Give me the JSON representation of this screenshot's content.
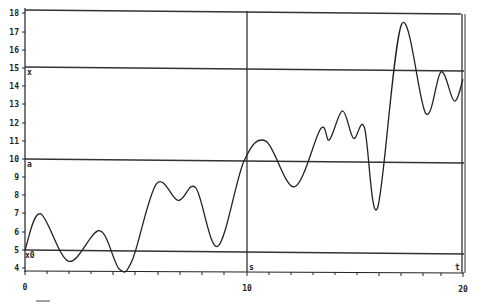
{
  "chart_data": {
    "type": "line",
    "title": "",
    "xlabel": "",
    "ylabel": "",
    "xlim": [
      0,
      20
    ],
    "ylim": [
      4,
      18
    ],
    "grid": false,
    "legend": null,
    "x_ticks": [
      "0",
      "10",
      "20"
    ],
    "y_ticks": [
      "4",
      "5",
      "6",
      "7",
      "8",
      "9",
      "10",
      "11",
      "12",
      "13",
      "14",
      "15",
      "16",
      "17",
      "18"
    ],
    "series": [
      {
        "name": "curve",
        "x": [
          0,
          0.7,
          2.0,
          3.4,
          4.3,
          4.9,
          6.0,
          7.0,
          7.8,
          8.8,
          10.0,
          11.0,
          12.3,
          13.5,
          13.9,
          14.5,
          15.0,
          15.5,
          16.1,
          17.2,
          18.3,
          19.0,
          19.6,
          20.0
        ],
        "values": [
          5.0,
          7.0,
          4.4,
          6.1,
          4.0,
          4.5,
          8.7,
          7.8,
          8.5,
          5.3,
          10.0,
          11.1,
          8.6,
          11.8,
          11.2,
          12.8,
          11.3,
          11.9,
          7.5,
          17.6,
          12.7,
          15.0,
          13.4,
          14.6
        ]
      }
    ],
    "reference_lines": {
      "horizontal": [
        {
          "y": 18,
          "label": ""
        },
        {
          "y": 15,
          "label": "x"
        },
        {
          "y": 10,
          "label": "a"
        },
        {
          "y": 5,
          "label": "x0"
        }
      ],
      "vertical": [
        {
          "x": 10,
          "label": "s"
        },
        {
          "x": 20,
          "label": "t"
        }
      ]
    },
    "annotations": [
      "x",
      "a",
      "x0",
      "s",
      "t"
    ]
  },
  "labels": {
    "x0": "0",
    "x10": "10",
    "x20": "20",
    "y4": "4",
    "y5": "5",
    "y6": "6",
    "y7": "7",
    "y8": "8",
    "y9": "9",
    "y10": "10",
    "y11": "11",
    "y12": "12",
    "y13": "13",
    "y14": "14",
    "y15": "15",
    "y16": "16",
    "y17": "17",
    "y18": "18",
    "ann_x": "x",
    "ann_a": "a",
    "ann_x0": "x0",
    "ann_s": "s",
    "ann_t": "t"
  }
}
